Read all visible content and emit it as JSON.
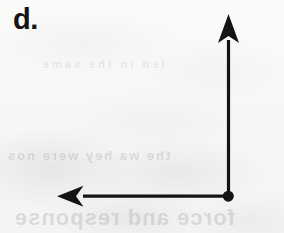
{
  "figure": {
    "label": "d.",
    "kind": "vector-diagram",
    "background_color": "#f8f8f6",
    "ink_color": "#141414",
    "canvas": {
      "width": 284,
      "height": 233
    },
    "origin": {
      "x": 228,
      "y": 196,
      "dot_radius": 5.5
    },
    "vectors": [
      {
        "name": "up-vector",
        "direction": "up",
        "from": {
          "x": 228,
          "y": 196
        },
        "to": {
          "x": 228,
          "y": 14
        },
        "length_px": 182,
        "shaft_width": 3.2,
        "arrowhead": "barbed",
        "arrowhead_length": 29,
        "arrowhead_width": 21
      },
      {
        "name": "left-vector",
        "direction": "left",
        "from": {
          "x": 228,
          "y": 196
        },
        "to": {
          "x": 57,
          "y": 196
        },
        "length_px": 171,
        "shaft_width": 3.2,
        "arrowhead": "barbed",
        "arrowhead_length": 26,
        "arrowhead_width": 21
      }
    ]
  },
  "bleed_through": {
    "line_1": "the  wa   hey  were   nos",
    "line_2": "force and response",
    "line_3": "ted  in  the  same"
  }
}
